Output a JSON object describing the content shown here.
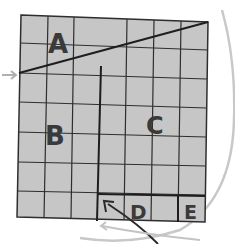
{
  "diagram": {
    "grid": {
      "columns": 7,
      "rows": 7,
      "fill": "#c6c6c6",
      "line_color": "#2e2e2e"
    },
    "regions": [
      {
        "id": "A",
        "label": "A"
      },
      {
        "id": "B",
        "label": "B"
      },
      {
        "id": "C",
        "label": "C"
      },
      {
        "id": "D",
        "label": "D"
      },
      {
        "id": "E",
        "label": "E"
      }
    ],
    "arrows": [
      {
        "name": "left-arrow",
        "color": "#b0b0b0"
      },
      {
        "name": "curved-arrow-to-d",
        "color": "#2a2a2a"
      },
      {
        "name": "circle-arc",
        "color": "#c8c8c8"
      }
    ]
  }
}
